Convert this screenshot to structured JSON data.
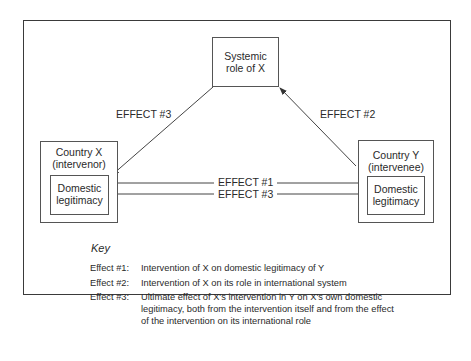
{
  "diagram": {
    "nodes": {
      "systemic": {
        "line1": "Systemic",
        "line2": "role of X"
      },
      "country_x": {
        "line1": "Country X",
        "line2": "(intervenor)",
        "inner1": "Domestic",
        "inner2": "legitimacy"
      },
      "country_y": {
        "line1": "Country Y",
        "line2": "(intervenee)",
        "inner1": "Domestic",
        "inner2": "legitimacy"
      }
    },
    "edges": {
      "effect3_diag": "EFFECT #3",
      "effect2_diag": "EFFECT #2",
      "effect1_horiz": "EFFECT #1",
      "effect3_horiz": "EFFECT #3"
    },
    "key": {
      "title": "Key",
      "items": [
        {
          "label": "Effect #1:",
          "text": "Intervention of X on domestic legitimacy of Y"
        },
        {
          "label": "Effect #2:",
          "text": "Intervention of X on its role in international system"
        },
        {
          "label": "Effect #3:",
          "text": "Ultimate effect of X's intervention in Y on X's own domestic legitimacy, both from the intervention itself and from the effect of the intervention on its international role"
        }
      ]
    }
  }
}
